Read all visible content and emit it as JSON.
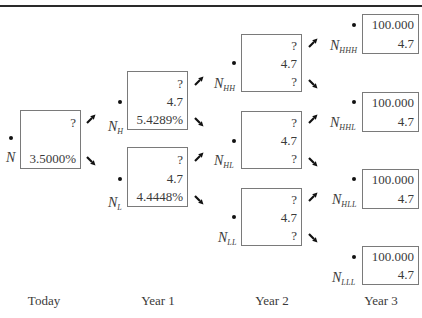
{
  "title_rule": true,
  "periods": [
    {
      "label": "Today"
    },
    {
      "label": "Year 1"
    },
    {
      "label": "Year 2"
    },
    {
      "label": "Year 3"
    }
  ],
  "nodes": {
    "N": {
      "label": "N",
      "sub": "",
      "value": "?",
      "coupon": "",
      "rate": "3.5000%"
    },
    "NH": {
      "label": "N",
      "sub": "H",
      "value": "?",
      "coupon": "4.7",
      "rate": "5.4289%"
    },
    "NL": {
      "label": "N",
      "sub": "L",
      "value": "?",
      "coupon": "4.7",
      "rate": "4.4448%"
    },
    "NHH": {
      "label": "N",
      "sub": "HH",
      "value": "?",
      "coupon": "4.7",
      "rate": "?"
    },
    "NHL": {
      "label": "N",
      "sub": "HL",
      "value": "?",
      "coupon": "4.7",
      "rate": "?"
    },
    "NLL": {
      "label": "N",
      "sub": "LL",
      "value": "?",
      "coupon": "4.7",
      "rate": "?"
    },
    "NHHH": {
      "label": "N",
      "sub": "HHH",
      "value": "100.000",
      "coupon": "4.7"
    },
    "NHHL": {
      "label": "N",
      "sub": "HHL",
      "value": "100.000",
      "coupon": "4.7"
    },
    "NHLL": {
      "label": "N",
      "sub": "HLL",
      "value": "100.000",
      "coupon": "4.7"
    },
    "NLLL": {
      "label": "N",
      "sub": "LLL",
      "value": "100.000",
      "coupon": "4.7"
    }
  },
  "arrows": {
    "up": "up-right-arrow",
    "down": "down-right-arrow"
  }
}
